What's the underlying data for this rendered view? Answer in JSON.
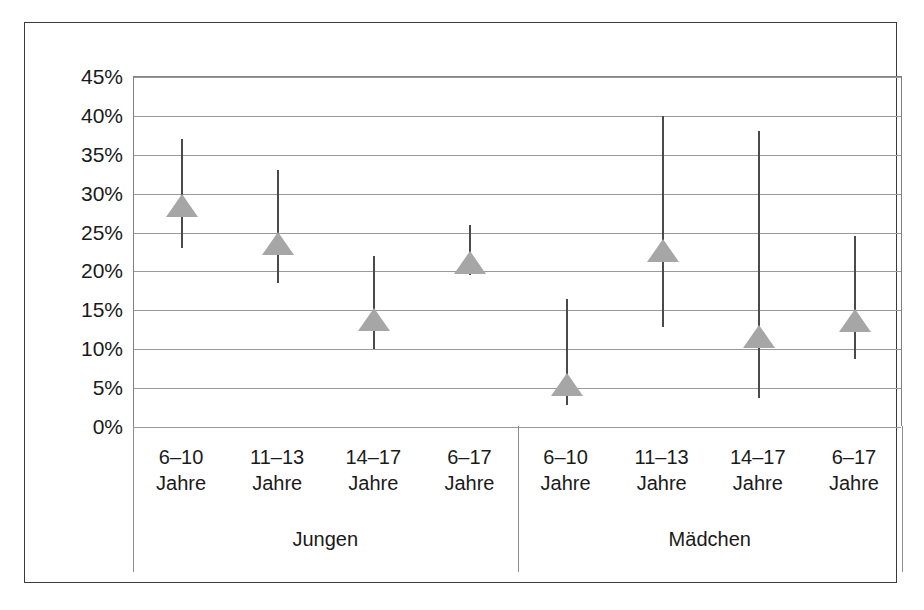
{
  "chart_data": {
    "type": "scatter",
    "title": "",
    "subtitle": "",
    "xlabel": "",
    "ylabel": "",
    "ylim": [
      0,
      45
    ],
    "ytick_step": 5,
    "grid": true,
    "legend": null,
    "yticks": [
      "45%",
      "40%",
      "35%",
      "30%",
      "25%",
      "20%",
      "15%",
      "10%",
      "5%",
      "0%"
    ],
    "ytick_values": [
      45,
      40,
      35,
      30,
      25,
      20,
      15,
      10,
      5,
      0
    ],
    "groups": [
      {
        "name": "Jungen",
        "categories": [
          "6–10\nJahre",
          "11–13\nJahre",
          "14–17\nJahre",
          "6–17\nJahre"
        ]
      },
      {
        "name": "Mädchen",
        "categories": [
          "6–10\nJahre",
          "11–13\nJahre",
          "14–17\nJahre",
          "6–17\nJahre"
        ]
      }
    ],
    "categories": [
      "6–10 Jahre",
      "11–13 Jahre",
      "14–17 Jahre",
      "6–17 Jahre",
      "6–10 Jahre",
      "11–13 Jahre",
      "14–17 Jahre",
      "6–17 Jahre"
    ],
    "series": [
      {
        "name": "Anteil mit Konfidenzintervall",
        "marker": "triangle",
        "marker_color": "#a6a6a6",
        "errorbar_color": "#4a4a4a",
        "values": [
          29.8,
          25.0,
          15.2,
          22.5,
          6.8,
          24.0,
          13.0,
          15.0
        ],
        "ci_low": [
          23.0,
          18.5,
          10.0,
          19.5,
          2.8,
          12.8,
          3.7,
          8.8
        ],
        "ci_high": [
          37.0,
          33.0,
          22.0,
          26.0,
          16.5,
          40.0,
          38.0,
          24.5
        ]
      }
    ],
    "points": [
      {
        "group": "Jungen",
        "category": "6–10 Jahre",
        "line1": "6–10",
        "line2": "Jahre",
        "value": 29.8,
        "ci_low": 23.0,
        "ci_high": 37.0
      },
      {
        "group": "Jungen",
        "category": "11–13 Jahre",
        "line1": "11–13",
        "line2": "Jahre",
        "value": 25.0,
        "ci_low": 18.5,
        "ci_high": 33.0
      },
      {
        "group": "Jungen",
        "category": "14–17 Jahre",
        "line1": "14–17",
        "line2": "Jahre",
        "value": 15.2,
        "ci_low": 10.0,
        "ci_high": 22.0
      },
      {
        "group": "Jungen",
        "category": "6–17 Jahre",
        "line1": "6–17",
        "line2": "Jahre",
        "value": 22.5,
        "ci_low": 19.5,
        "ci_high": 26.0
      },
      {
        "group": "Mädchen",
        "category": "6–10 Jahre",
        "line1": "6–10",
        "line2": "Jahre",
        "value": 6.8,
        "ci_low": 2.8,
        "ci_high": 16.5
      },
      {
        "group": "Mädchen",
        "category": "11–13 Jahre",
        "line1": "11–13",
        "line2": "Jahre",
        "value": 24.0,
        "ci_low": 12.8,
        "ci_high": 40.0
      },
      {
        "group": "Mädchen",
        "category": "14–17 Jahre",
        "line1": "14–17",
        "line2": "Jahre",
        "value": 13.0,
        "ci_low": 3.7,
        "ci_high": 38.0
      },
      {
        "group": "Mädchen",
        "category": "6–17 Jahre",
        "line1": "6–17",
        "line2": "Jahre",
        "value": 15.0,
        "ci_low": 8.8,
        "ci_high": 24.5
      }
    ],
    "colors": {
      "marker": "#a6a6a6",
      "errorbar": "#4a4a4a",
      "gridline": "#9a9a9a",
      "frame": "#3a3a3a",
      "text": "#1a1a1a",
      "background": "#ffffff"
    }
  }
}
